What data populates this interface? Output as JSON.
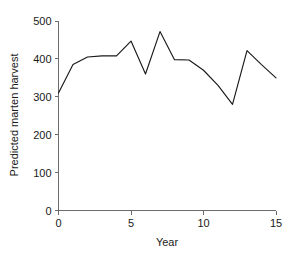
{
  "chart_data": {
    "type": "line",
    "title": "",
    "subtitle": "",
    "xlabel": "Year",
    "ylabel": "Predicted marten harvest",
    "xlim": [
      0,
      15
    ],
    "ylim": [
      0,
      500
    ],
    "xticks": [
      0,
      5,
      10,
      15
    ],
    "yticks": [
      0,
      100,
      200,
      300,
      400,
      500
    ],
    "xtick_labels": [
      "0",
      "5",
      "10",
      "15"
    ],
    "ytick_labels": [
      "0",
      "100",
      "200",
      "300",
      "400",
      "500"
    ],
    "grid": false,
    "legend": false,
    "legend_position": "none",
    "line_color": "#1a1a1a",
    "axis_color": "#6b6b6b",
    "background_color": "#ffffff",
    "x": [
      0,
      1,
      2,
      3,
      4,
      5,
      6,
      7,
      8,
      9,
      10,
      11,
      12,
      13,
      14,
      15
    ],
    "values": [
      310,
      385,
      405,
      408,
      408,
      447,
      360,
      472,
      398,
      397,
      370,
      330,
      280,
      422,
      385,
      350
    ],
    "series": [
      {
        "name": "Predicted marten harvest",
        "values": [
          310,
          385,
          405,
          408,
          408,
          447,
          360,
          472,
          398,
          397,
          370,
          330,
          280,
          422,
          385,
          350
        ]
      }
    ]
  }
}
